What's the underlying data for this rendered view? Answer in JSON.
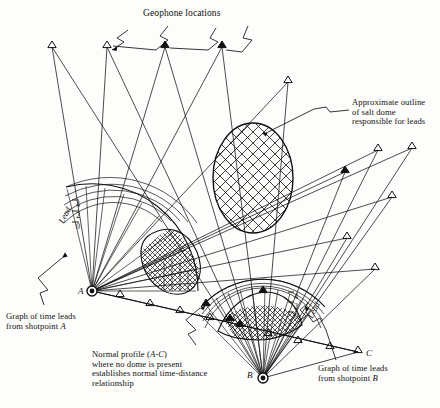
{
  "figure": {
    "kind": "seismic-fan-shooting-diagram",
    "background": "#fdfdfb",
    "ink": "#101010"
  },
  "annotations": {
    "geophone_locations": "Geophone locations",
    "salt_dome_l1": "Approximate outline",
    "salt_dome_l2": "of salt dome",
    "salt_dome_l3": "responsible for leads",
    "graph_a_l1": "Graph of time leads",
    "graph_a_l2": "from shotpoint",
    "graph_a_pt": "A",
    "graph_b_l1": "Graph of time leads",
    "graph_b_l2": "from shotpoint",
    "graph_b_pt": "B",
    "normal_l1a": "Normal profile (",
    "normal_l1b": "A-C",
    "normal_l1c": ")",
    "normal_l2": "where no dome is present",
    "normal_l3": "establishes normal time-distance",
    "normal_l4": "relationship"
  },
  "shotpoints": [
    {
      "id": "A",
      "label": "A",
      "x": 92,
      "y": 291,
      "label_x": 78,
      "label_y": 286
    },
    {
      "id": "B",
      "label": "B",
      "x": 263,
      "y": 378,
      "label_x": 247,
      "label_y": 370
    }
  ],
  "endpoint": {
    "label": "C",
    "x": 358,
    "y": 352,
    "label_x": 366,
    "label_y": 348
  },
  "axis_a": {
    "word": "Lead",
    "word_x": 56,
    "word_y": 210,
    "ticks": [
      "4",
      "2",
      "0"
    ],
    "tick_x": 76,
    "tick_ys": [
      200,
      211,
      222
    ]
  },
  "axis_b": {
    "word": "Lead",
    "word_x": 305,
    "word_y": 305,
    "ticks": [
      "4",
      "2",
      "0"
    ],
    "tick_x": 294,
    "tick_ys": [
      292,
      302,
      312
    ]
  },
  "chart_data": {
    "type": "line",
    "xlabel": "",
    "ylabel": "Lead",
    "ylim": [
      0,
      4
    ],
    "grid": true,
    "legend": "none",
    "series": [
      {
        "name": "Time leads fan from shotpoint A",
        "units": "lead (arbitrary time units)",
        "axis_ticks": [
          0,
          2,
          4
        ],
        "note": "Radial polar plot centred on shotpoint A; lead plotted outward along each geophone ray. Shaded/hatched lobe marks rays crossing the salt dome.",
        "values": [
          0,
          0,
          0,
          0.3,
          1.6,
          3.4,
          4.0,
          3.6,
          2.0,
          0.5,
          0,
          0,
          0
        ]
      },
      {
        "name": "Time leads fan from shotpoint B",
        "units": "lead (arbitrary time units)",
        "axis_ticks": [
          0,
          2,
          4
        ],
        "note": "Radial polar plot centred on shotpoint B; hatched lobe marks rays crossing the salt dome.",
        "values": [
          0,
          0.2,
          1.2,
          2.8,
          3.9,
          4.0,
          3.2,
          1.5,
          0.4,
          0,
          0
        ]
      }
    ],
    "annotations": [
      "Geophone locations",
      "Approximate outline of salt dome responsible for leads",
      "Graph of time leads from shotpoint A",
      "Graph of time leads from shotpoint B",
      "Normal profile (A-C) where no dome is present establishes normal time-distance relationship"
    ]
  },
  "geophones": {
    "count_top": 5,
    "count_right": 6,
    "count_profile_a": 5,
    "count_profile_b": 4,
    "positions_top": [
      [
        52,
        45
      ],
      [
        107,
        45
      ],
      [
        165,
        45
      ],
      [
        222,
        45
      ],
      [
        288,
        80
      ]
    ],
    "positions_right": [
      [
        378,
        148
      ],
      [
        412,
        146
      ],
      [
        345,
        170
      ],
      [
        392,
        195
      ],
      [
        347,
        236
      ],
      [
        375,
        267
      ]
    ],
    "positions_profile": [
      [
        120,
        296
      ],
      [
        150,
        305
      ],
      [
        180,
        313
      ],
      [
        210,
        320
      ],
      [
        240,
        328
      ],
      [
        268,
        336
      ],
      [
        298,
        343
      ],
      [
        330,
        349
      ],
      [
        358,
        352
      ]
    ],
    "positions_fan_b": [
      [
        230,
        320
      ],
      [
        248,
        300
      ],
      [
        263,
        292
      ],
      [
        282,
        300
      ],
      [
        298,
        313
      ]
    ]
  }
}
